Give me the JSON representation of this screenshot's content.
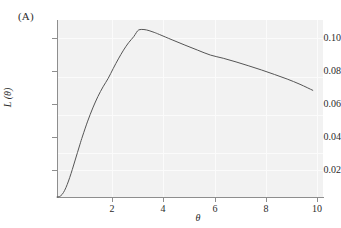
{
  "figure": {
    "panel_label": "(A)",
    "background_color": "#ffffff",
    "plot_background_color": "#f2f2f2",
    "axis_color": "#8e8e8e",
    "curve_color": "#555555",
    "gridline_color": "#fbfbfb"
  },
  "chart_data": {
    "type": "line",
    "title": "",
    "subtitle": "",
    "panel": "(A)",
    "xlabel": "θ",
    "ylabel": "L (θ)",
    "xlim": [
      0,
      10.4
    ],
    "ylim": [
      0,
      0.1115
    ],
    "xticks": [
      2,
      4,
      6,
      8,
      10
    ],
    "xticklabels": [
      "2",
      "4",
      "6",
      "8",
      "10"
    ],
    "yticks": [
      0.02,
      0.04,
      0.06,
      0.08,
      0.1
    ],
    "yticklabels": [
      "0.02",
      "0.04",
      "0.06",
      "0.08",
      "0.10"
    ],
    "grid": true,
    "legend": null,
    "annotations": [],
    "series": [
      {
        "name": "L(θ)",
        "color": "#555555",
        "linewidth": 1,
        "x": [
          0.0,
          0.1,
          0.2,
          0.3,
          0.4,
          0.5,
          0.6,
          0.7,
          0.8,
          0.9,
          1.0,
          1.2,
          1.4,
          1.6,
          1.8,
          2.0,
          2.2,
          2.4,
          2.6,
          2.8,
          3.0,
          3.1,
          3.2,
          3.4,
          3.6,
          3.8,
          4.0,
          4.5,
          5.0,
          5.5,
          6.0,
          6.5,
          7.0,
          7.5,
          8.0,
          8.5,
          9.0,
          9.5,
          10.0
        ],
        "y": [
          0.0,
          0.0003,
          0.0016,
          0.0042,
          0.0079,
          0.0124,
          0.0174,
          0.0227,
          0.028,
          0.0333,
          0.0384,
          0.0478,
          0.0561,
          0.0633,
          0.0694,
          0.0747,
          0.081,
          0.087,
          0.0925,
          0.0972,
          0.101,
          0.1035,
          0.1053,
          0.1055,
          0.1048,
          0.1037,
          0.1024,
          0.099,
          0.0957,
          0.0925,
          0.0894,
          0.0874,
          0.0851,
          0.0826,
          0.08,
          0.0772,
          0.0743,
          0.071,
          0.0672
        ]
      }
    ]
  }
}
